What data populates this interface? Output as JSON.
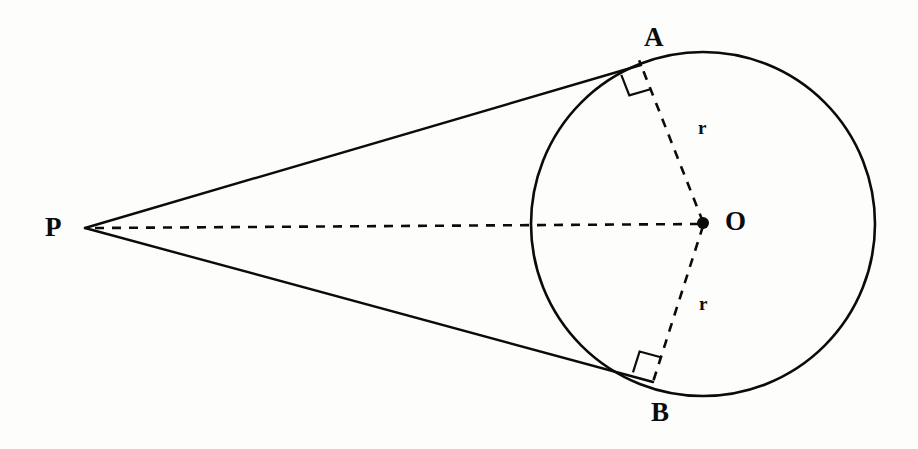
{
  "figure": {
    "background_color": "#fdfdfc",
    "stroke_color": "#0b0b0b",
    "canvas": {
      "width": 918,
      "height": 449
    }
  },
  "labels": {
    "point_a": "A",
    "point_b": "B",
    "center_o": "O",
    "external_p": "P",
    "radius_upper": "r",
    "radius_lower": "r"
  },
  "geometry": {
    "circle": {
      "cx": 703,
      "cy": 224,
      "r": 172
    },
    "external_point": {
      "x": 85,
      "y": 228
    },
    "tangent_point_a": {
      "x": 641,
      "y": 65
    },
    "tangent_point_b": {
      "x": 653,
      "y": 382
    },
    "center_dot_radius": 6,
    "axis_line": {
      "x1": 95,
      "y1": 228,
      "x2": 700,
      "y2": 224
    },
    "right_angle_marker_size": 22
  },
  "style": {
    "solid_stroke_width": 2.4,
    "circle_stroke_width": 2.6,
    "dashed_stroke_width": 2.6,
    "dash_pattern": "9 8",
    "marker_stroke_width": 2.2
  }
}
